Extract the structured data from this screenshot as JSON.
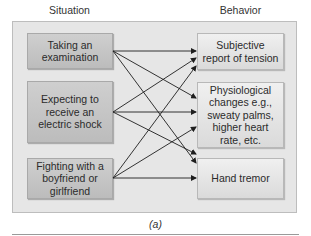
{
  "diagram": {
    "column_titles": {
      "left": "Situation",
      "right": "Behavior"
    },
    "situations": [
      {
        "id": "S1",
        "label": "Taking an examination"
      },
      {
        "id": "S2",
        "label": "Expecting to receive an electric shock"
      },
      {
        "id": "S3",
        "label": "Fighting with a boyfriend or girlfriend"
      }
    ],
    "behaviors": [
      {
        "id": "B1",
        "label": "Subjective report of tension"
      },
      {
        "id": "B2",
        "label": "Physiological changes e.g., sweaty palms, higher heart rate, etc."
      },
      {
        "id": "B3",
        "label": "Hand tremor"
      }
    ],
    "edges": [
      {
        "from": "S1",
        "to": "B1"
      },
      {
        "from": "S1",
        "to": "B2"
      },
      {
        "from": "S1",
        "to": "B3"
      },
      {
        "from": "S2",
        "to": "B1"
      },
      {
        "from": "S2",
        "to": "B2"
      },
      {
        "from": "S2",
        "to": "B3"
      },
      {
        "from": "S3",
        "to": "B1"
      },
      {
        "from": "S3",
        "to": "B2"
      },
      {
        "from": "S3",
        "to": "B3"
      }
    ],
    "caption": "(a)",
    "colors": {
      "panel": "#e6e6e6",
      "situation_box": "#c4c4c4",
      "behavior_box": "#e4e4e4",
      "arrow": "#1e1e1e"
    }
  }
}
